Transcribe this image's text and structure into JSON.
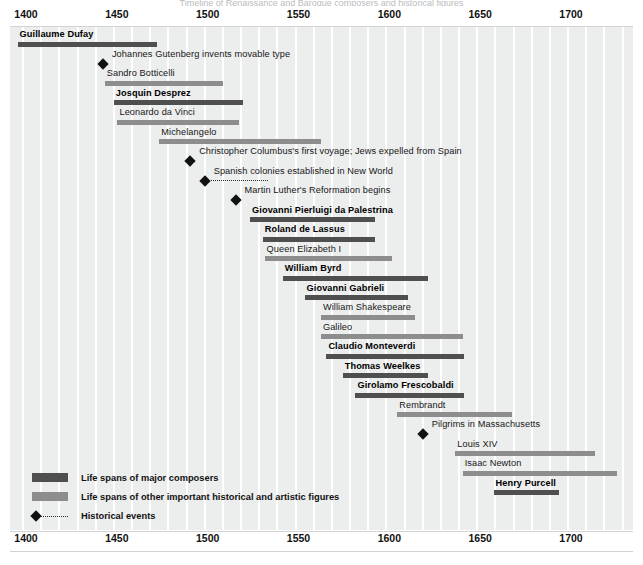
{
  "chart_data": {
    "type": "bar",
    "title": "Timeline of Renaissance and Baroque composers and historical figures",
    "xlabel": "",
    "ylabel": "",
    "xlim": [
      1390,
      1730
    ],
    "grid": true,
    "grid_interval": 10,
    "axis_ticks": [
      1400,
      1450,
      1500,
      1550,
      1600,
      1650,
      1700
    ],
    "legend_position": "bottom-left",
    "series": [
      {
        "name": "Life spans of major composers",
        "color": "#4f4f4f",
        "values": [
          {
            "label": "Guillaume Dufay",
            "start": 1397,
            "end": 1474
          },
          {
            "label": "Josquin Desprez",
            "start": 1450,
            "end": 1521
          },
          {
            "label": "Giovanni Pierluigi da Palestrina",
            "start": 1525,
            "end": 1594
          },
          {
            "label": "Roland de Lassus",
            "start": 1532,
            "end": 1594
          },
          {
            "label": "William Byrd",
            "start": 1543,
            "end": 1623
          },
          {
            "label": "Giovanni Gabrieli",
            "start": 1555,
            "end": 1612
          },
          {
            "label": "Claudio Monteverdi",
            "start": 1567,
            "end": 1643
          },
          {
            "label": "Thomas Weelkes",
            "start": 1576,
            "end": 1623
          },
          {
            "label": "Girolamo Frescobaldi",
            "start": 1583,
            "end": 1643
          },
          {
            "label": "Henry Purcell",
            "start": 1659,
            "end": 1695
          }
        ]
      },
      {
        "name": "Life spans of other important historical and artistic figures",
        "color": "#8d8d8d",
        "values": [
          {
            "label": "Sandro Botticelli",
            "start": 1445,
            "end": 1510
          },
          {
            "label": "Leonardo da Vinci",
            "start": 1452,
            "end": 1519
          },
          {
            "label": "Michelangelo",
            "start": 1475,
            "end": 1564
          },
          {
            "label": "Queen Elizabeth I",
            "start": 1533,
            "end": 1603
          },
          {
            "label": "William Shakespeare",
            "start": 1564,
            "end": 1616
          },
          {
            "label": "Galileo",
            "start": 1564,
            "end": 1642
          },
          {
            "label": "Rembrandt",
            "start": 1606,
            "end": 1669
          },
          {
            "label": "Louis XIV",
            "start": 1638,
            "end": 1715
          },
          {
            "label": "Isaac Newton",
            "start": 1642,
            "end": 1727
          }
        ]
      },
      {
        "name": "Historical events",
        "color": "#111111",
        "values": [
          {
            "label": "Johannes Gutenberg invents movable type",
            "year": 1444,
            "span_end": null
          },
          {
            "label": "Christopher Columbus's first voyage; Jews expelled from Spain",
            "year": 1492,
            "span_end": null
          },
          {
            "label": "Spanish colonies established in New World",
            "year": 1500,
            "span_end": 1535
          },
          {
            "label": "Martin Luther's Reformation begins",
            "year": 1517,
            "span_end": null
          },
          {
            "label": "Pilgrims in Massachusetts",
            "year": 1620,
            "span_end": null
          }
        ]
      }
    ],
    "rows": [
      {
        "label": "Guillaume Dufay",
        "kind": "major",
        "start": 1397,
        "end": 1474
      },
      {
        "label": "Johannes Gutenberg invents movable type",
        "kind": "event",
        "year": 1444
      },
      {
        "label": "Sandro Botticelli",
        "kind": "other",
        "start": 1445,
        "end": 1510
      },
      {
        "label": "Josquin Desprez",
        "kind": "major",
        "start": 1450,
        "end": 1521
      },
      {
        "label": "Leonardo da Vinci",
        "kind": "other",
        "start": 1452,
        "end": 1519
      },
      {
        "label": "Michelangelo",
        "kind": "other",
        "start": 1475,
        "end": 1564
      },
      {
        "label": "Christopher Columbus's first voyage; Jews expelled from Spain",
        "kind": "event",
        "year": 1492
      },
      {
        "label": "Spanish colonies established in New World",
        "kind": "event",
        "year": 1500,
        "span_end": 1535
      },
      {
        "label": "Martin Luther's Reformation begins",
        "kind": "event",
        "year": 1517
      },
      {
        "label": "Giovanni Pierluigi da Palestrina",
        "kind": "major",
        "start": 1525,
        "end": 1594
      },
      {
        "label": "Roland de Lassus",
        "kind": "major",
        "start": 1532,
        "end": 1594
      },
      {
        "label": "Queen Elizabeth I",
        "kind": "other",
        "start": 1533,
        "end": 1603
      },
      {
        "label": "William Byrd",
        "kind": "major",
        "start": 1543,
        "end": 1623
      },
      {
        "label": "Giovanni Gabrieli",
        "kind": "major",
        "start": 1555,
        "end": 1612
      },
      {
        "label": "William Shakespeare",
        "kind": "other",
        "start": 1564,
        "end": 1616
      },
      {
        "label": "Galileo",
        "kind": "other",
        "start": 1564,
        "end": 1642
      },
      {
        "label": "Claudio Monteverdi",
        "kind": "major",
        "start": 1567,
        "end": 1643
      },
      {
        "label": "Thomas Weelkes",
        "kind": "major",
        "start": 1576,
        "end": 1623
      },
      {
        "label": "Girolamo Frescobaldi",
        "kind": "major",
        "start": 1583,
        "end": 1643
      },
      {
        "label": "Rembrandt",
        "kind": "other",
        "start": 1606,
        "end": 1669
      },
      {
        "label": "Pilgrims in Massachusetts",
        "kind": "event",
        "year": 1620
      },
      {
        "label": "Louis XIV",
        "kind": "other",
        "start": 1638,
        "end": 1715
      },
      {
        "label": "Isaac Newton",
        "kind": "other",
        "start": 1642,
        "end": 1727
      },
      {
        "label": "Henry Purcell",
        "kind": "major",
        "start": 1659,
        "end": 1695
      }
    ]
  },
  "axis": {
    "ticks": [
      "1400",
      "1450",
      "1500",
      "1550",
      "1600",
      "1650",
      "1700"
    ]
  },
  "legend": {
    "items": [
      {
        "swatch": "major",
        "label": "Life spans of major composers"
      },
      {
        "swatch": "other",
        "label": "Life spans of other important historical and artistic figures"
      },
      {
        "swatch": "event",
        "label": "Historical events"
      }
    ]
  }
}
